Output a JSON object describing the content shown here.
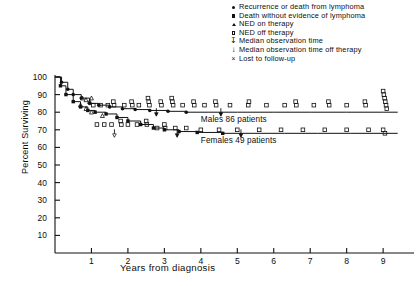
{
  "chart_data": {
    "type": "line",
    "title": "",
    "xlabel": "Years from diagnosis",
    "ylabel": "Percent Surviving",
    "xlim": [
      0,
      9.6
    ],
    "ylim": [
      0,
      103
    ],
    "xticks": [
      "1",
      "2",
      "3",
      "4",
      "5",
      "6",
      "7",
      "8",
      "9"
    ],
    "yticks": [
      "10",
      "20",
      "30",
      "40",
      "50",
      "60",
      "70",
      "80",
      "90",
      "100"
    ],
    "grid": false,
    "legend_position": "top-right",
    "series": [
      {
        "name": "Males",
        "annotation": "Males  86 patients",
        "n_patients": 86,
        "x": [
          0,
          0.18,
          0.35,
          0.5,
          0.72,
          0.95,
          1.2,
          1.5,
          1.85,
          2.2,
          2.6,
          3.1,
          3.6,
          4.2,
          5.0,
          6.0,
          7.0,
          8.0,
          9.0,
          9.4
        ],
        "y": [
          100,
          97,
          93,
          90,
          88,
          85,
          84,
          83,
          82,
          81.5,
          81,
          80.5,
          80,
          80,
          80,
          80,
          80,
          80,
          80,
          80
        ]
      },
      {
        "name": "Females",
        "annotation": "Females  49 patients",
        "n_patients": 49,
        "x": [
          0,
          0.15,
          0.3,
          0.5,
          0.7,
          0.9,
          1.1,
          1.4,
          1.7,
          2.0,
          2.35,
          2.7,
          3.0,
          3.4,
          3.9,
          4.6,
          5.4,
          6.3,
          7.2,
          8.1,
          9.0,
          9.4
        ],
        "y": [
          100,
          95,
          90,
          86,
          83,
          81,
          80,
          79,
          77,
          75,
          73,
          71,
          70,
          69,
          68.5,
          68,
          68,
          68,
          68,
          68,
          68,
          68
        ]
      }
    ]
  },
  "legend": {
    "items": [
      {
        "marker": "filled-circle",
        "label": "Recurrence or death from lymphoma"
      },
      {
        "marker": "filled-square",
        "label": "Death without evidence of lymphoma"
      },
      {
        "marker": "open-triangle",
        "label": "NED on therapy"
      },
      {
        "marker": "open-square",
        "label": "NED off therapy"
      },
      {
        "marker": "down-arrow-open",
        "label": "Median observation time"
      },
      {
        "marker": "down-arrow-filled",
        "label": "Median observation time off therapy"
      },
      {
        "marker": "cross-x",
        "label": "Lost to follow-up"
      }
    ]
  },
  "colors": {
    "ink": "#111111",
    "background": "#ffffff"
  }
}
